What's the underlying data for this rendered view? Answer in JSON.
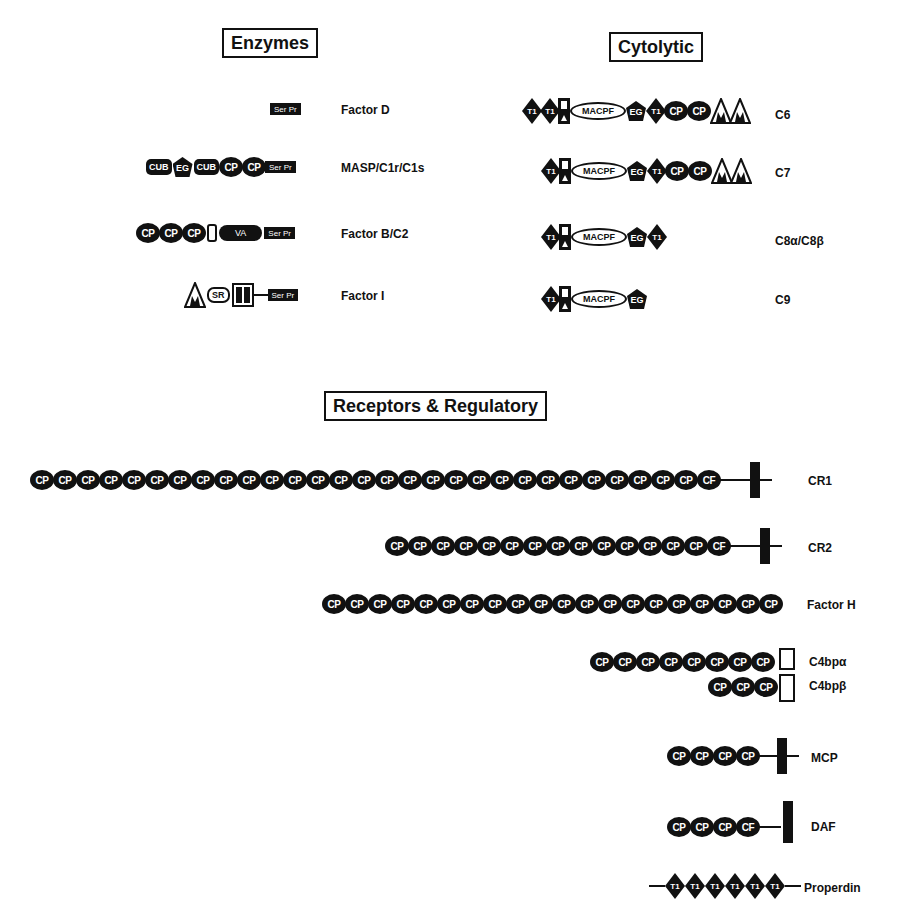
{
  "sections": {
    "enzymes": "Enzymes",
    "cytolytic": "Cytolytic",
    "receptors": "Receptors & Regulatory"
  },
  "module_labels": {
    "cp": "CP",
    "cp_truncated": "CF",
    "ser_pr": "Ser Pr",
    "cub": "CUB",
    "eg": "EG",
    "va": "VA",
    "t1": "T1",
    "macpf": "MACPF",
    "sr": "SR"
  },
  "enzymes": [
    {
      "name": "Factor D",
      "modules": [
        "SerPr"
      ]
    },
    {
      "name": "MASP/C1r/C1s",
      "modules": [
        "CUB",
        "EG",
        "CUB",
        "CP",
        "CP",
        "SerPr"
      ]
    },
    {
      "name": "Factor B/C2",
      "modules": [
        "CP",
        "CP",
        "CP",
        "vWA-linker",
        "VA",
        "SerPr"
      ]
    },
    {
      "name": "Factor I",
      "modules": [
        "FIM",
        "SR",
        "LDL",
        "LDL",
        "linker",
        "SerPr"
      ]
    }
  ],
  "cytolytic": [
    {
      "name": "C6",
      "modules": [
        "T1",
        "T1",
        "LDL",
        "MACPF",
        "EG",
        "T1",
        "CP",
        "CP",
        "FIM",
        "FIM"
      ]
    },
    {
      "name": "C7",
      "modules": [
        "T1",
        "LDL",
        "MACPF",
        "EG",
        "T1",
        "CP",
        "CP",
        "FIM",
        "FIM"
      ]
    },
    {
      "name": "C8α/C8β",
      "modules": [
        "T1",
        "LDL",
        "MACPF",
        "EG",
        "T1"
      ]
    },
    {
      "name": "C9",
      "modules": [
        "T1",
        "LDL",
        "MACPF",
        "EG"
      ]
    }
  ],
  "receptors": [
    {
      "name": "CR1",
      "cp_count": 30,
      "transmembrane": true
    },
    {
      "name": "CR2",
      "cp_count": 15,
      "transmembrane": true
    },
    {
      "name": "Factor H",
      "cp_count": 20,
      "transmembrane": false
    },
    {
      "name": "C4bpα",
      "cp_count": 8,
      "transmembrane": false
    },
    {
      "name": "C4bpβ",
      "cp_count": 3,
      "transmembrane": false
    },
    {
      "name": "MCP",
      "cp_count": 4,
      "transmembrane": true
    },
    {
      "name": "DAF",
      "cp_count": 4,
      "gpi_anchor": true
    },
    {
      "name": "Properdin",
      "t1_count": 6
    }
  ]
}
